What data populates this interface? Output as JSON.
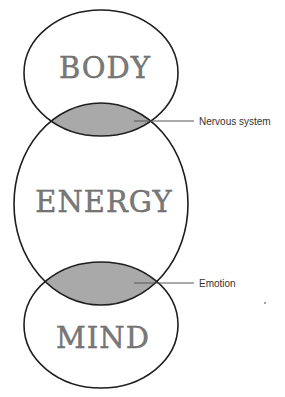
{
  "diagram": {
    "type": "stacked-venn",
    "regions": [
      {
        "id": "body",
        "label": "BODY"
      },
      {
        "id": "energy",
        "label": "ENERGY"
      },
      {
        "id": "mind",
        "label": "MIND"
      }
    ],
    "overlaps": [
      {
        "between": [
          "body",
          "energy"
        ],
        "label": "Nervous system"
      },
      {
        "between": [
          "energy",
          "mind"
        ],
        "label": "Emotion"
      }
    ],
    "colors": {
      "outline": "#1e1e1e",
      "overlap_fill": "#a9a9a9",
      "text": "#7a7a7a",
      "callout_line": "#555555"
    }
  }
}
